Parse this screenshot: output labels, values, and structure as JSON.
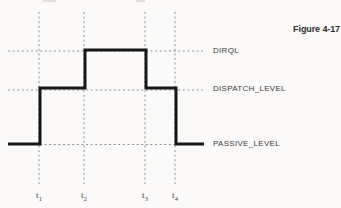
{
  "figure": {
    "caption": "Figure 4-17"
  },
  "chart_data": {
    "type": "line",
    "subtype": "step",
    "title": "Figure 4-17",
    "xlabel": "time",
    "ylabel": "IRQL",
    "x_ticks": [
      "t1",
      "t2",
      "t3",
      "t4"
    ],
    "y_levels": [
      "PASSIVE_LEVEL",
      "DISPATCH_LEVEL",
      "DIRQL"
    ],
    "grid": "dotted",
    "legend": "none",
    "series": [
      {
        "name": "IRQL",
        "segments": [
          {
            "from": "start",
            "to": "t1",
            "level": "PASSIVE_LEVEL"
          },
          {
            "from": "t1",
            "to": "t2",
            "level": "DISPATCH_LEVEL"
          },
          {
            "from": "t2",
            "to": "t3",
            "level": "DIRQL"
          },
          {
            "from": "t3",
            "to": "t4",
            "level": "DISPATCH_LEVEL"
          },
          {
            "from": "t4",
            "to": "end",
            "level": "PASSIVE_LEVEL"
          }
        ]
      }
    ]
  },
  "levels": [
    {
      "name": "DIRQL",
      "dash_y": 51,
      "label_y": 51,
      "dash_x1": 8,
      "dash_x2": 203
    },
    {
      "name": "DISPATCH_LEVEL",
      "dash_y": 90,
      "label_y": 89,
      "dash_x1": 8,
      "dash_x2": 203
    },
    {
      "name": "PASSIVE_LEVEL",
      "dash_y": 144.5,
      "label_y": 144,
      "dash_x1": 40,
      "dash_x2": 175
    }
  ],
  "time_marks": [
    {
      "base": "t",
      "sub": "1",
      "x": 39
    },
    {
      "base": "t",
      "sub": "2",
      "x": 84
    },
    {
      "base": "t",
      "sub": "3",
      "x": 145
    },
    {
      "base": "t",
      "sub": "4",
      "x": 175
    }
  ],
  "step_points": [
    [
      8,
      144
    ],
    [
      40,
      144
    ],
    [
      40,
      88
    ],
    [
      85,
      88
    ],
    [
      85,
      50
    ],
    [
      146,
      50
    ],
    [
      146,
      88
    ],
    [
      176,
      88
    ],
    [
      176,
      144
    ],
    [
      204,
      144
    ]
  ],
  "geometry": {
    "canvas_width": 341,
    "canvas_height": 208,
    "gridline_top": 12,
    "gridline_bottom": 186,
    "tick_label_top": 190,
    "level_label_x": 213
  },
  "colors": {
    "background": "#fbfaf9",
    "step_line": "#161616",
    "dotted_line": "#8f8f8f",
    "level_label_text": "#3a3a3a",
    "caption_text": "#2d2d2d"
  },
  "artifacts": [
    {
      "x": 43,
      "y": 0,
      "w": 13,
      "h": 2
    },
    {
      "x": 136,
      "y": 0,
      "w": 9,
      "h": 2
    }
  ]
}
